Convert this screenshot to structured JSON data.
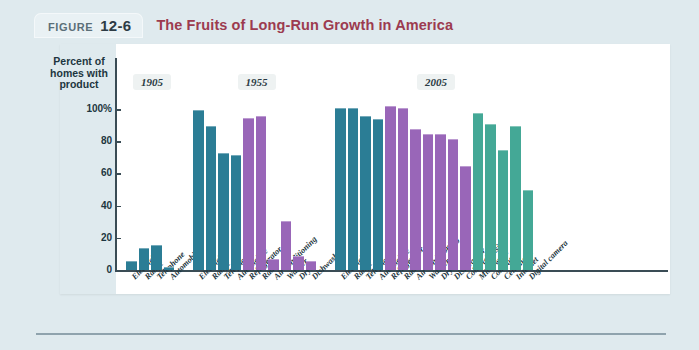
{
  "figure": {
    "label_word": "FIGURE",
    "number": "12-6",
    "title": "The Fruits of Long-Run Growth in America",
    "title_color": "#9c3b4f"
  },
  "chart_data": {
    "type": "bar",
    "title": "The Fruits of Long-Run Growth in America",
    "xlabel": "",
    "ylabel": "Percent of homes with product",
    "ylim": [
      0,
      110
    ],
    "yticks": [
      0,
      20,
      40,
      60,
      80,
      100
    ],
    "ytick_labels": [
      "0",
      "20",
      "40",
      "60",
      "80",
      "100%"
    ],
    "grid": false,
    "legend": "none",
    "group_labels": [
      "1905",
      "1955",
      "2005"
    ],
    "colors": {
      "teal": "#2b7d95",
      "purple": "#9966b8",
      "green": "#44a896",
      "panel_background": "#ffffff",
      "page_background": "#dfeaee",
      "axis": "#3a4c55"
    },
    "groups": [
      {
        "name": "1905",
        "categories": [
          "Electricity",
          "Range",
          "Telephone",
          "Automobile"
        ],
        "values": [
          5,
          13,
          15,
          1.5
        ],
        "colors": [
          "teal",
          "teal",
          "teal",
          "teal"
        ]
      },
      {
        "name": "1955",
        "categories": [
          "Electricity",
          "Range",
          "Telephone",
          "Automobile",
          "Refrigerator",
          "Radio",
          "Air conditioning",
          "Washer",
          "Dryer",
          "Dishwasher"
        ],
        "values": [
          99,
          89,
          72,
          71,
          94,
          95,
          6,
          30,
          8,
          5
        ],
        "colors": [
          "teal",
          "teal",
          "teal",
          "teal",
          "purple",
          "purple",
          "purple",
          "purple",
          "purple",
          "purple"
        ]
      },
      {
        "name": "2005",
        "categories": [
          "Electricity",
          "Range",
          "Telephone",
          "Automobile",
          "Refrigerator",
          "Radio",
          "Air conditioning",
          "Washer",
          "Dryer",
          "Dishwasher",
          "Color television",
          "Microwave",
          "Computer",
          "Cell phone",
          "Internet",
          "Digital camera"
        ],
        "values": [
          100,
          100,
          95,
          93,
          101,
          100,
          87,
          84,
          84,
          81,
          64,
          97,
          90,
          74,
          89,
          49
        ],
        "colors": [
          "teal",
          "teal",
          "teal",
          "teal",
          "purple",
          "purple",
          "purple",
          "purple",
          "purple",
          "purple",
          "purple",
          "green",
          "green",
          "green",
          "green",
          "green"
        ]
      }
    ]
  }
}
